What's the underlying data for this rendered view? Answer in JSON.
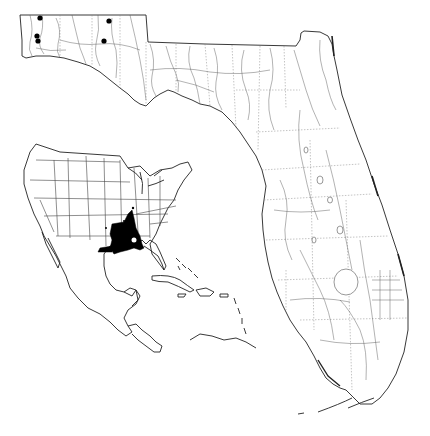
{
  "figure": {
    "type": "species-distribution-map",
    "main_map": {
      "region": "Florida",
      "style": "black-and-white line map with rivers, lakes, and county boundaries",
      "locality_markers": {
        "symbol": "filled-circle",
        "color": "#000000",
        "points": [
          {
            "x": 40,
            "y": 18
          },
          {
            "x": 37,
            "y": 36
          },
          {
            "x": 38,
            "y": 41
          },
          {
            "x": 109,
            "y": 21
          },
          {
            "x": 104,
            "y": 41
          }
        ]
      }
    },
    "inset_map": {
      "region": "North America, Central America and Caribbean",
      "range_fill_color": "#000000",
      "range_description": "shaded range centered on lower Mississippi valley and Gulf coast"
    },
    "colors": {
      "background": "#ffffff",
      "line": "#222222",
      "range": "#000000"
    }
  }
}
